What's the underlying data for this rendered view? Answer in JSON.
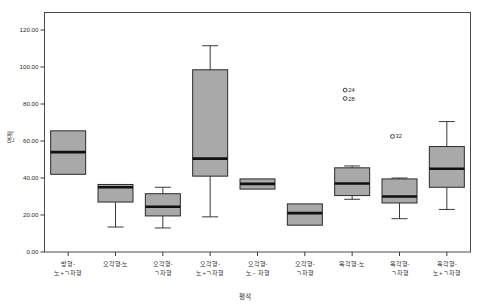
{
  "chart_data": {
    "type": "box",
    "title": "",
    "xlabel": "평석",
    "ylabel": "면적",
    "ylim": [
      0,
      120
    ],
    "ytick_labels": [
      "120.00",
      "100.00",
      "80.00",
      "60.00",
      "40.00",
      "20.00",
      "0.00"
    ],
    "ytick_values": [
      120,
      100,
      80,
      60,
      40,
      20,
      0
    ],
    "grid": false,
    "legend": "none",
    "categories": [
      "방형-\n노+ㄱ자형",
      "오각형-노",
      "오각형-\nㄱ자형",
      "오각형-\n노+ㄱ자형",
      "오각형-\n노←자형",
      "오각형-\nㄱ자형",
      "육각형-노",
      "육각형-\nㄱ자형",
      "육각형-\n노+ㄱ자형"
    ],
    "category_lines": [
      [
        "방형-",
        "노+ㄱ자형"
      ],
      [
        "오각형-노",
        ""
      ],
      [
        "오각형-",
        "ㄱ자형"
      ],
      [
        "오각형-",
        "노+ㄱ자형"
      ],
      [
        "오각형-",
        "노←자형"
      ],
      [
        "오각형-",
        "ㄱ자형"
      ],
      [
        "육각형-노",
        ""
      ],
      [
        "육각형-",
        "ㄱ자형"
      ],
      [
        "육각형-",
        "노+ㄱ자형"
      ]
    ],
    "boxes": [
      {
        "category": "방형-노+ㄱ자형",
        "whisker_low": 42.0,
        "q1": 42.0,
        "median": 54.0,
        "q3": 65.5,
        "whisker_high": 65.5
      },
      {
        "category": "오각형-노",
        "whisker_low": 13.5,
        "q1": 27.0,
        "median": 35.0,
        "q3": 36.5,
        "whisker_high": 36.5
      },
      {
        "category": "오각형-ㄱ자형",
        "whisker_low": 13.0,
        "q1": 19.5,
        "median": 24.5,
        "q3": 31.5,
        "whisker_high": 35.0
      },
      {
        "category": "오각형-노+ㄱ자형",
        "whisker_low": 19.0,
        "q1": 41.0,
        "median": 50.5,
        "q3": 98.5,
        "whisker_high": 111.5
      },
      {
        "category": "오각형-노←자형",
        "whisker_low": 34.0,
        "q1": 34.0,
        "median": 36.8,
        "q3": 39.5,
        "whisker_high": 39.5
      },
      {
        "category": "오각형-ㄱ자형",
        "whisker_low": 14.5,
        "q1": 14.5,
        "median": 21.0,
        "q3": 26.0,
        "whisker_high": 26.0
      },
      {
        "category": "육각형-노",
        "whisker_low": 28.5,
        "q1": 30.5,
        "median": 37.0,
        "q3": 45.5,
        "whisker_high": 46.5
      },
      {
        "category": "육각형-ㄱ자형",
        "whisker_low": 18.0,
        "q1": 26.5,
        "median": 30.0,
        "q3": 39.5,
        "whisker_high": 40.0
      },
      {
        "category": "육각형-노+ㄱ자형",
        "whisker_low": 23.0,
        "q1": 35.0,
        "median": 45.0,
        "q3": 57.0,
        "whisker_high": 70.5
      }
    ],
    "outliers": [
      {
        "category_index": 6,
        "label": "24",
        "value": 87.5
      },
      {
        "category_index": 6,
        "label": "28",
        "value": 83.0
      },
      {
        "category_index": 7,
        "label": "32",
        "value": 62.5
      }
    ],
    "colors": {
      "box_fill": "#a9a9a9",
      "box_stroke": "#2a2a2a",
      "median": "#101010",
      "whisker": "#3a3a3a",
      "frame": "#4a4a4a",
      "text": "#2b2b2b",
      "background": "#ffffff"
    }
  }
}
